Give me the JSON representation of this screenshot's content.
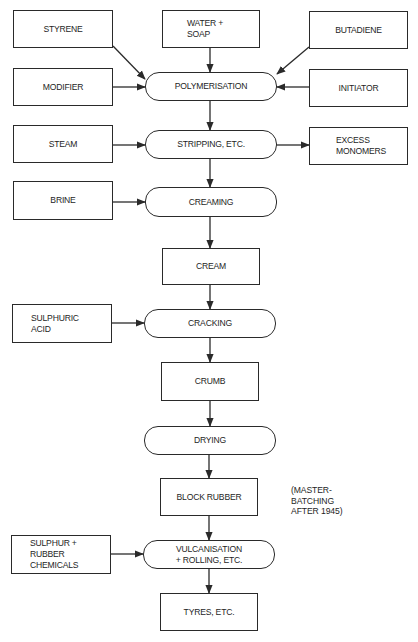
{
  "diagram": {
    "type": "flowchart",
    "orientation": "top-to-bottom",
    "colors": {
      "background": "#ffffff",
      "stroke": "#2a2a2a",
      "text": "#1e1e1e"
    },
    "inputs": {
      "styrene": "STYRENE",
      "water_soap": "WATER +\nSOAP",
      "butadiene": "BUTADIENE",
      "modifier": "MODIFIER",
      "initiator": "INITIATOR",
      "steam": "STEAM",
      "brine": "BRINE",
      "sulphuric_acid": "SULPHURIC\nACID",
      "sulphur_chemicals": "SULPHUR +\nRUBBER\nCHEMICALS"
    },
    "outputs": {
      "excess_monomers": "EXCESS\nMONOMERS"
    },
    "process_steps": {
      "polymerisation": "POLYMERISATION",
      "stripping": "STRIPPING, ETC.",
      "creaming": "CREAMING",
      "cracking": "CRACKING",
      "drying": "DRYING",
      "vulcanisation": "VULCANISATION\n+ ROLLING, ETC."
    },
    "products": {
      "cream": "CREAM",
      "crumb": "CRUMB",
      "block_rubber": "BLOCK RUBBER",
      "tyres": "TYRES, ETC."
    },
    "annotations": {
      "master_batching": "(MASTER-\n BATCHING\n AFTER 1945)"
    },
    "edges": [
      [
        "STYRENE",
        "POLYMERISATION"
      ],
      [
        "WATER + SOAP",
        "POLYMERISATION"
      ],
      [
        "BUTADIENE",
        "POLYMERISATION"
      ],
      [
        "MODIFIER",
        "POLYMERISATION"
      ],
      [
        "INITIATOR",
        "POLYMERISATION"
      ],
      [
        "POLYMERISATION",
        "STRIPPING, ETC."
      ],
      [
        "STEAM",
        "STRIPPING, ETC."
      ],
      [
        "STRIPPING, ETC.",
        "EXCESS MONOMERS"
      ],
      [
        "STRIPPING, ETC.",
        "CREAMING"
      ],
      [
        "BRINE",
        "CREAMING"
      ],
      [
        "CREAMING",
        "CREAM"
      ],
      [
        "CREAM",
        "CRACKING"
      ],
      [
        "SULPHURIC ACID",
        "CRACKING"
      ],
      [
        "CRACKING",
        "CRUMB"
      ],
      [
        "CRUMB",
        "DRYING"
      ],
      [
        "DRYING",
        "BLOCK RUBBER"
      ],
      [
        "BLOCK RUBBER",
        "VULCANISATION + ROLLING, ETC."
      ],
      [
        "SULPHUR + RUBBER CHEMICALS",
        "VULCANISATION + ROLLING, ETC."
      ],
      [
        "VULCANISATION + ROLLING, ETC.",
        "TYRES, ETC."
      ]
    ]
  }
}
